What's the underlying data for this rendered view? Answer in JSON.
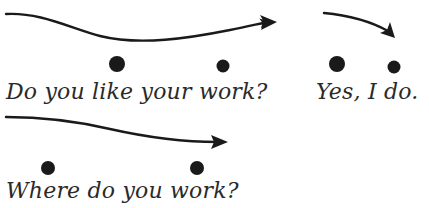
{
  "diagram": {
    "colors": {
      "ink": "#1a1a1a",
      "text": "#2a2a2a",
      "background": "#ffffff"
    },
    "phrases": [
      {
        "id": "question-1",
        "text": "Do you like your work?",
        "pattern": "falling-then-rising",
        "stressed_dots": [
          {
            "word": "like",
            "size": "large"
          },
          {
            "word": "work",
            "size": "small"
          }
        ]
      },
      {
        "id": "answer-1",
        "text": "Yes, I do.",
        "pattern": "falling",
        "stressed_dots": [
          {
            "word": "Yes",
            "size": "large"
          },
          {
            "word": "do",
            "size": "small"
          }
        ]
      },
      {
        "id": "question-2",
        "text": "Where do you work?",
        "pattern": "falling",
        "stressed_dots": [
          {
            "word": "Where",
            "size": "medium"
          },
          {
            "word": "work",
            "size": "medium"
          }
        ]
      }
    ]
  }
}
